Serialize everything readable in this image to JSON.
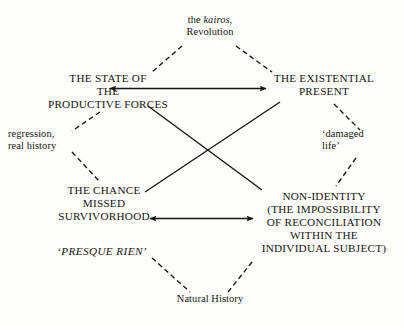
{
  "figure": {
    "background_color": "#fdfdfc",
    "ink_color": "#17150f",
    "width": 404,
    "height": 326
  },
  "nodes": {
    "kairos": {
      "line1_prefix": "the ",
      "line1_italic": "kairos",
      "line1_suffix": ",",
      "line2": "Revolution"
    },
    "state_of_productive_forces": {
      "line1": "THE STATE OF",
      "line2": "THE",
      "line3": "PRODUCTIVE FORCES"
    },
    "existential_present": {
      "line1": "THE EXISTENTIAL",
      "line2": "PRESENT"
    },
    "regression": {
      "line1": "regression,",
      "line2": "real history"
    },
    "damaged_life": {
      "line1": "‘damaged",
      "line2": "life’"
    },
    "chance_missed": {
      "line1": "THE CHANCE",
      "line2": "MISSED"
    },
    "non_identity": {
      "line1": "NON-IDENTITY",
      "line2": "(THE IMPOSSIBILITY",
      "line3": "OF RECONCILIATION",
      "line4": "WITHIN THE",
      "line5": "INDIVIDUAL SUBJECT)"
    },
    "survivorhood": {
      "label": "SURVIVORHOOD"
    },
    "presque_rien": {
      "label": "‘PRESQUE RIEN’"
    },
    "natural_history": {
      "label": "Natural History"
    }
  },
  "edges": [
    {
      "name": "kairos-to-state",
      "style": "dashed",
      "from": "kairos",
      "to": "state_of_productive_forces"
    },
    {
      "name": "kairos-to-existential",
      "style": "dashed",
      "from": "kairos",
      "to": "existential_present"
    },
    {
      "name": "state-to-regression",
      "style": "dashed",
      "from": "state_of_productive_forces",
      "to": "regression"
    },
    {
      "name": "regression-to-chance",
      "style": "dashed",
      "from": "regression",
      "to": "chance_missed"
    },
    {
      "name": "existential-to-damaged",
      "style": "dashed",
      "from": "existential_present",
      "to": "damaged_life"
    },
    {
      "name": "damaged-to-nonidentity",
      "style": "dashed",
      "from": "damaged_life",
      "to": "non_identity"
    },
    {
      "name": "presque-to-natural",
      "style": "dashed",
      "from": "presque_rien",
      "to": "natural_history"
    },
    {
      "name": "natural-to-nonidentity",
      "style": "dashed",
      "from": "natural_history",
      "to": "non_identity"
    },
    {
      "name": "state-to-existential-arrow",
      "style": "solid-double-arrow",
      "from": "state_of_productive_forces",
      "to": "existential_present"
    },
    {
      "name": "survivorhood-to-nonidentity-arrow",
      "style": "solid-double-arrow",
      "from": "survivorhood",
      "to": "non_identity"
    },
    {
      "name": "state-to-nonidentity-diagonal",
      "style": "solid",
      "from": "state_of_productive_forces",
      "to": "non_identity"
    },
    {
      "name": "existential-to-chance-diagonal",
      "style": "solid",
      "from": "existential_present",
      "to": "chance_missed"
    }
  ]
}
